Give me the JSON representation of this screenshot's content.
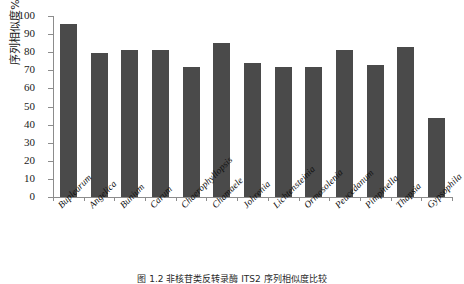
{
  "chart_data": {
    "type": "bar",
    "title": "",
    "xlabel": "",
    "ylabel": "序列相似度%",
    "ylim": [
      0,
      100
    ],
    "yticks": [
      0,
      10,
      20,
      30,
      40,
      50,
      60,
      70,
      80,
      90,
      100
    ],
    "grid": false,
    "legend": null,
    "bar_color": "#4a4a4a",
    "axis_color": "#8c8c8c",
    "categories": [
      "Bupleurum",
      "Angelica",
      "Bunium",
      "Carum",
      "Chaerophyllopsis",
      "Chamaele",
      "Johrenia",
      "Lichtensteinia",
      "Ormosolenia",
      "Peucedanum",
      "Pimpinella",
      "Thapsia",
      "Gypsophila"
    ],
    "values": [
      95.5,
      79.5,
      81,
      81,
      72,
      85,
      74,
      72,
      72,
      81,
      73,
      83,
      43.5
    ]
  },
  "caption": {
    "text": "图 1.2  非核苷类反转录酶 ITS2 序列相似度比较"
  }
}
